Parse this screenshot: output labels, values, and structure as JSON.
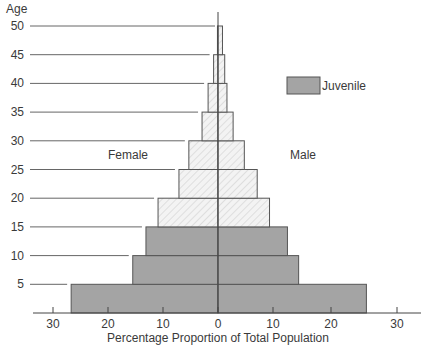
{
  "chart_data": {
    "type": "bar",
    "subtype": "population-pyramid",
    "title": "",
    "ylabel": "Age",
    "xlabel": "Percentage Proportion of Total Population",
    "xlim": [
      -30,
      30
    ],
    "ylim": [
      0,
      50
    ],
    "x_ticks": [
      -30,
      -20,
      -10,
      0,
      10,
      20,
      30
    ],
    "x_tick_labels": [
      "30",
      "20",
      "10",
      "0",
      "10",
      "20",
      "30"
    ],
    "y_ticks": [
      5,
      10,
      15,
      20,
      25,
      30,
      35,
      40,
      45,
      50
    ],
    "y_tick_labels": [
      "5",
      "10",
      "15",
      "20",
      "25",
      "30",
      "35",
      "40",
      "45",
      "50"
    ],
    "side_labels": {
      "left": "Female",
      "right": "Male"
    },
    "legend": [
      {
        "label": "Juvenile",
        "fill": "solid-gray"
      }
    ],
    "legend_position": "top-right",
    "grid": false,
    "age_groups": [
      "0-5",
      "5-10",
      "10-15",
      "15-20",
      "20-25",
      "25-30",
      "30-35",
      "35-40",
      "40-45",
      "45-50"
    ],
    "series": [
      {
        "name": "Female",
        "values": [
          26.7,
          15.5,
          13.1,
          10.9,
          7.1,
          5.3,
          2.9,
          1.8,
          0.8,
          0.1
        ]
      },
      {
        "name": "Male",
        "values": [
          26.5,
          14.4,
          12.4,
          9.2,
          7.0,
          4.7,
          2.7,
          1.6,
          1.2,
          0.8
        ]
      }
    ],
    "juvenile_groups": [
      "0-5",
      "5-10",
      "10-15"
    ],
    "colors": {
      "juvenile": "#a4a4a4",
      "adult_fill": "#f2f2f2",
      "adult_hatch": "#c8c8c8",
      "stroke": "#555555"
    }
  }
}
